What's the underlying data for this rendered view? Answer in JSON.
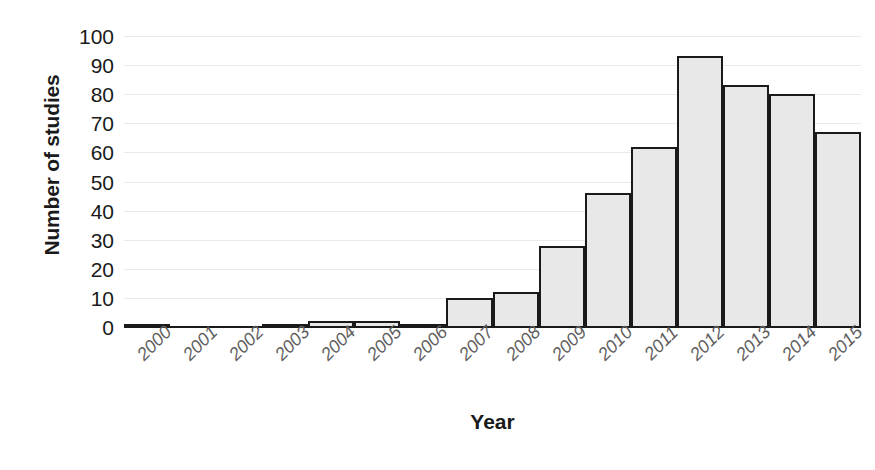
{
  "chart_data": {
    "type": "bar",
    "title": "",
    "xlabel": "Year",
    "ylabel": "Number of studies",
    "categories": [
      "2000",
      "2001",
      "2002",
      "2003",
      "2004",
      "2005",
      "2006",
      "2007",
      "2008",
      "2009",
      "2010",
      "2011",
      "2012",
      "2013",
      "2014",
      "2015"
    ],
    "values": [
      1,
      0,
      0,
      1,
      2,
      2,
      1,
      10,
      12,
      28,
      46,
      62,
      93,
      83,
      80,
      67
    ],
    "ylim": [
      0,
      100
    ],
    "ytick_labels": [
      "0",
      "10",
      "20",
      "30",
      "40",
      "50",
      "60",
      "70",
      "80",
      "90",
      "100"
    ],
    "ytick_values": [
      0,
      10,
      20,
      30,
      40,
      50,
      60,
      70,
      80,
      90,
      100
    ],
    "ytick_step": 10,
    "grid": true,
    "grid_axis": "y",
    "legend": false,
    "legend_position": "none",
    "bar_fill_color": "#e8e8e8",
    "bar_border_color": "#1a1a1a",
    "gridline_color": "#e9e9ef",
    "axis_color": "#1a1a1a",
    "tick_label_color": "#5e5e5e",
    "xtick_rotation_deg": -45
  }
}
